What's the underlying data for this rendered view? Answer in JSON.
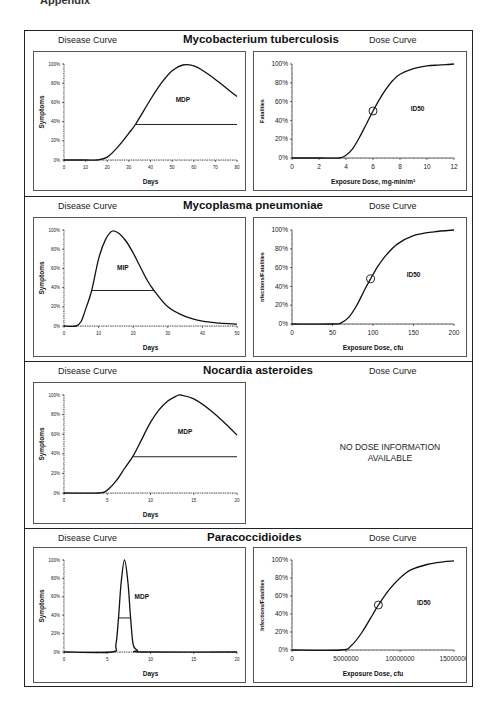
{
  "page": {
    "header_fragment": "Appendix"
  },
  "labels": {
    "disease_curve": "Disease Curve",
    "dose_curve": "Dose Curve"
  },
  "sections": [
    {
      "title": "Mycobacterium tuberculosis",
      "disease": {
        "annotation": "MDP",
        "ylabel": "Symptoms",
        "xlabel": "Days",
        "xticks": [
          "0",
          "10",
          "20",
          "30",
          "40",
          "50",
          "60",
          "70",
          "80"
        ],
        "yticks": [
          "0%",
          "20%",
          "40%",
          "60%",
          "80%",
          "100%"
        ]
      },
      "dose": {
        "annotation": "ID50",
        "ylabel": "Fatalities",
        "xlabel": "Exposure Dose, mg-min/m³",
        "xticks": [
          "0",
          "2",
          "4",
          "6",
          "8",
          "10",
          "12"
        ],
        "yticks": [
          "0%",
          "20%",
          "40%",
          "60%",
          "80%",
          "100%"
        ]
      }
    },
    {
      "title": "Mycoplasma pneumoniae",
      "disease": {
        "annotation": "MIP",
        "ylabel": "Symptoms",
        "xlabel": "Days",
        "xticks": [
          "0",
          "10",
          "20",
          "30",
          "40",
          "50"
        ],
        "yticks": [
          "0%",
          "20%",
          "40%",
          "60%",
          "80%",
          "100%"
        ]
      },
      "dose": {
        "annotation": "ID50",
        "ylabel": "nfections/Fatalities",
        "xlabel": "Exposure Dose, cfu",
        "xticks": [
          "0",
          "50",
          "100",
          "150",
          "200"
        ],
        "yticks": [
          "0%",
          "20%",
          "40%",
          "60%",
          "80%",
          "100%"
        ]
      }
    },
    {
      "title": "Nocardia asteroides",
      "disease": {
        "annotation": "MDP",
        "ylabel": "Symptoms",
        "xlabel": "Days",
        "xticks": [
          "0",
          "5",
          "10",
          "15",
          "20"
        ],
        "yticks": [
          "0%",
          "20%",
          "40%",
          "60%",
          "80%",
          "100%"
        ]
      },
      "dose": {
        "no_data_line1": "NO DOSE INFORMATION",
        "no_data_line2": "AVAILABLE"
      }
    },
    {
      "title": "Paracoccidioides",
      "disease": {
        "annotation": "MDP",
        "ylabel": "Symptoms",
        "xlabel": "Days",
        "xticks": [
          "0",
          "5",
          "10",
          "15",
          "20"
        ],
        "yticks": [
          "0%",
          "20%",
          "40%",
          "60%",
          "80%",
          "100%"
        ]
      },
      "dose": {
        "annotation": "ID50",
        "ylabel": "Infections/Fatalities",
        "xlabel": "Exposure Dose, cfu",
        "xticks": [
          "0",
          "5000000",
          "10000000",
          "15000000"
        ],
        "yticks": [
          "0%",
          "20%",
          "40%",
          "60%",
          "80%",
          "100%"
        ]
      }
    }
  ],
  "chart_data": [
    {
      "type": "line",
      "title": "Mycobacterium tuberculosis — Disease Curve",
      "xlabel": "Days",
      "ylabel": "Symptoms",
      "xlim": [
        0,
        80
      ],
      "ylim": [
        0,
        100
      ],
      "x": [
        0,
        10,
        15,
        20,
        25,
        30,
        33,
        40,
        45,
        50,
        55,
        60,
        65,
        70,
        75,
        80
      ],
      "values": [
        0,
        0,
        0,
        3,
        14,
        28,
        37,
        63,
        80,
        93,
        99,
        98,
        92,
        84,
        75,
        66
      ],
      "threshold_line": {
        "y": 37,
        "x_start": 33,
        "x_end": 80,
        "label": "MDP"
      },
      "annotations": [
        "MDP"
      ]
    },
    {
      "type": "line",
      "title": "Mycobacterium tuberculosis — Dose Curve",
      "xlabel": "Exposure Dose, mg-min/m³",
      "ylabel": "Fatalities",
      "xlim": [
        0,
        12
      ],
      "ylim": [
        0,
        100
      ],
      "x": [
        0,
        2,
        3.5,
        4,
        4.5,
        5,
        5.5,
        6,
        6.5,
        7,
        7.5,
        8,
        9,
        10,
        11,
        12
      ],
      "values": [
        0,
        0,
        0,
        3,
        10,
        22,
        36,
        50,
        63,
        74,
        83,
        89,
        95,
        98,
        99,
        100
      ],
      "marker": {
        "x": 6,
        "y": 50,
        "label": "ID50"
      },
      "annotations": [
        "ID50"
      ]
    },
    {
      "type": "line",
      "title": "Mycoplasma pneumoniae — Disease Curve",
      "xlabel": "Days",
      "ylabel": "Symptoms",
      "xlim": [
        0,
        50
      ],
      "ylim": [
        0,
        100
      ],
      "x": [
        0,
        3.5,
        5,
        6,
        8,
        10,
        12,
        14,
        16,
        18,
        20,
        22,
        24,
        26,
        30,
        35,
        40,
        45,
        50
      ],
      "values": [
        0,
        0,
        5,
        15,
        37,
        70,
        90,
        99,
        96,
        88,
        76,
        62,
        48,
        37,
        20,
        10,
        5,
        3,
        2
      ],
      "threshold_line": {
        "y": 37,
        "x_start": 8,
        "x_end": 26,
        "label": "MIP"
      },
      "annotations": [
        "MIP"
      ]
    },
    {
      "type": "line",
      "title": "Mycoplasma pneumoniae — Dose Curve",
      "xlabel": "Exposure Dose, cfu",
      "ylabel": "nfections/Fatalities",
      "xlim": [
        0,
        200
      ],
      "ylim": [
        0,
        100
      ],
      "x": [
        0,
        50,
        60,
        70,
        80,
        90,
        97,
        105,
        115,
        130,
        150,
        175,
        200
      ],
      "values": [
        0,
        0,
        1,
        7,
        20,
        37,
        48,
        60,
        72,
        85,
        94,
        98,
        100
      ],
      "marker": {
        "x": 97,
        "y": 48,
        "label": "ID50"
      },
      "annotations": [
        "ID50"
      ]
    },
    {
      "type": "line",
      "title": "Nocardia asteroides — Disease Curve",
      "xlabel": "Days",
      "ylabel": "Symptoms",
      "xlim": [
        0,
        20
      ],
      "ylim": [
        0,
        100
      ],
      "x": [
        0,
        4,
        5,
        6,
        7,
        8,
        9,
        10,
        11,
        12,
        13,
        13.5,
        15,
        17,
        19,
        20
      ],
      "values": [
        0,
        0,
        3,
        12,
        25,
        38,
        55,
        72,
        85,
        94,
        99,
        100,
        96,
        84,
        68,
        59
      ],
      "threshold_line": {
        "y": 37,
        "x_start": 8,
        "x_end": 20,
        "label": "MDP"
      },
      "annotations": [
        "MDP"
      ]
    },
    {
      "type": "text",
      "title": "Nocardia asteroides — Dose Curve",
      "annotations": [
        "NO DOSE INFORMATION AVAILABLE"
      ]
    },
    {
      "type": "line",
      "title": "Paracoccidioides — Disease Curve",
      "xlabel": "Days",
      "ylabel": "Symptoms",
      "xlim": [
        0,
        20
      ],
      "ylim": [
        0,
        100
      ],
      "x": [
        0,
        5.5,
        6,
        6.3,
        6.6,
        7,
        7.4,
        7.7,
        8,
        8.5,
        9,
        20
      ],
      "values": [
        0,
        0,
        8,
        37,
        75,
        100,
        75,
        37,
        8,
        2,
        0,
        0
      ],
      "threshold_line": {
        "y": 37,
        "x_start": 6.3,
        "x_end": 7.7,
        "label": "MDP"
      },
      "annotations": [
        "MDP"
      ]
    },
    {
      "type": "line",
      "title": "Paracoccidioides — Dose Curve",
      "xlabel": "Exposure Dose, cfu",
      "ylabel": "Infections/Fatalities",
      "xlim": [
        0,
        15000000
      ],
      "ylim": [
        0,
        100
      ],
      "x": [
        0,
        4500000,
        5500000,
        6500000,
        7500000,
        8000000,
        9000000,
        10000000,
        11000000,
        12500000,
        14000000,
        15000000
      ],
      "values": [
        0,
        0,
        5,
        20,
        40,
        50,
        67,
        80,
        89,
        95,
        98,
        99
      ],
      "marker": {
        "x": 8000000,
        "y": 50,
        "label": "ID50"
      },
      "annotations": [
        "ID50"
      ]
    }
  ]
}
